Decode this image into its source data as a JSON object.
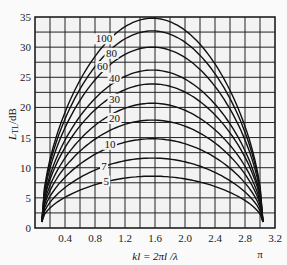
{
  "chart_data": {
    "type": "line",
    "title": "",
    "xlabel": "kl = 2πl / λ",
    "ylabel": "L_TL/dB",
    "xlim": [
      0,
      3.2
    ],
    "ylim": [
      0,
      35
    ],
    "grid": true,
    "x_ticks": [
      "0.4",
      "0.8",
      "1.2",
      "1.6",
      "2.0",
      "2.4",
      "2.8",
      "3.2"
    ],
    "y_ticks": [
      "0",
      "5",
      "10",
      "15",
      "20",
      "25",
      "30",
      "35"
    ],
    "extra_x_label": "π",
    "series": [
      {
        "name": "100",
        "peak_x": 1.57,
        "peak_y": 34.8,
        "start": [
          0.09,
          1.0
        ],
        "end": [
          3.04,
          1.0
        ]
      },
      {
        "name": "80",
        "peak_x": 1.57,
        "peak_y": 32.7,
        "start": [
          0.09,
          1.0
        ],
        "end": [
          3.04,
          1.0
        ]
      },
      {
        "name": "60",
        "peak_x": 1.57,
        "peak_y": 30.0,
        "start": [
          0.09,
          1.0
        ],
        "end": [
          3.04,
          1.0
        ]
      },
      {
        "name": "40",
        "peak_x": 1.57,
        "peak_y": 26.2,
        "start": [
          0.09,
          1.0
        ],
        "end": [
          3.04,
          1.0
        ]
      },
      {
        "name": "30",
        "peak_x": 1.57,
        "peak_y": 23.9,
        "start": [
          0.09,
          1.0
        ],
        "end": [
          3.04,
          1.0
        ]
      },
      {
        "name": "20",
        "peak_x": 1.57,
        "peak_y": 20.7,
        "start": [
          0.09,
          1.0
        ],
        "end": [
          3.04,
          1.0
        ]
      },
      {
        "name": "",
        "peak_x": 1.57,
        "peak_y": 17.9,
        "start": [
          0.09,
          1.0
        ],
        "end": [
          3.04,
          1.0
        ]
      },
      {
        "name": "10",
        "peak_x": 1.57,
        "peak_y": 14.8,
        "start": [
          0.09,
          1.0
        ],
        "end": [
          3.04,
          1.0
        ]
      },
      {
        "name": "7",
        "peak_x": 1.57,
        "peak_y": 11.6,
        "start": [
          0.09,
          1.0
        ],
        "end": [
          3.04,
          1.0
        ]
      },
      {
        "name": "5",
        "peak_x": 1.57,
        "peak_y": 8.6,
        "start": [
          0.09,
          1.0
        ],
        "end": [
          3.04,
          1.0
        ]
      }
    ],
    "curve_labels": [
      {
        "text": "100",
        "x": 0.92,
        "y": 30.8
      },
      {
        "text": "80",
        "x": 1.02,
        "y": 28.4
      },
      {
        "text": "60",
        "x": 0.9,
        "y": 26.2
      },
      {
        "text": "40",
        "x": 1.06,
        "y": 24.3
      },
      {
        "text": "30",
        "x": 1.06,
        "y": 20.8
      },
      {
        "text": "20",
        "x": 1.06,
        "y": 17.6
      },
      {
        "text": "10",
        "x": 1.0,
        "y": 13.3
      },
      {
        "text": "7",
        "x": 0.92,
        "y": 9.6
      },
      {
        "text": "5",
        "x": 0.95,
        "y": 7.2
      }
    ]
  },
  "axes": {
    "ylabel_main": "L",
    "ylabel_sub": "TL",
    "ylabel_unit": "/dB",
    "xlabel": "kl = 2πl /λ",
    "pi_label": "π"
  }
}
